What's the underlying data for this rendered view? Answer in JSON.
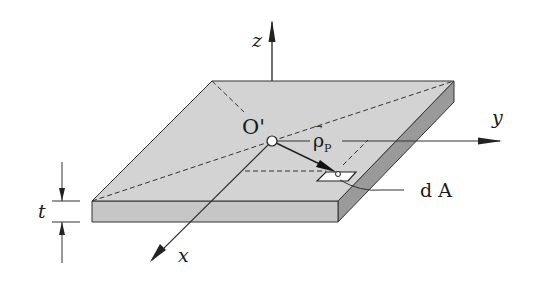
{
  "figure": {
    "colors": {
      "top_face": "#d3d3d3",
      "front_face": "#c6c6c6",
      "side_face": "#9a9a9a",
      "edge": "#333333",
      "background": "#ffffff"
    }
  },
  "labels": {
    "z_axis": "z",
    "y_axis": "y",
    "x_axis": "x",
    "origin": "O'",
    "position_vector": "ρ",
    "position_vector_subscript": "P",
    "vector_arrow": "→",
    "area_element": "d A",
    "thickness": "t"
  }
}
